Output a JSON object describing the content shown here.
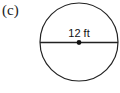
{
  "figure": {
    "part_label": "(c)",
    "shape": "circle",
    "diameter_label": "12 ft",
    "colors": {
      "stroke": "#222222",
      "background": "#ffffff"
    }
  }
}
